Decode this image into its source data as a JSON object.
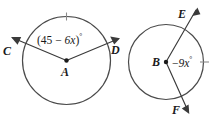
{
  "figure": {
    "type": "geometry-diagram",
    "background_color": "#ffffff",
    "stroke_color": "#3a3a3a",
    "tick_color": "#8a8a8a"
  },
  "circle_a": {
    "center_label": "A",
    "point_c_label": "C",
    "point_d_label": "D",
    "angle_expression_prefix": "(45 ",
    "angle_expression_minus": "−",
    "angle_expression_var": " 6x",
    "angle_expression_suffix": ")",
    "degree_symbol": "°",
    "angle_expression_full": "(45 − 6x)°"
  },
  "circle_b": {
    "center_label": "B",
    "point_e_label": "E",
    "point_f_label": "F",
    "angle_expression_minus": "−",
    "angle_expression_var": "9x",
    "degree_symbol": "°",
    "angle_expression_full": "−9x°"
  }
}
